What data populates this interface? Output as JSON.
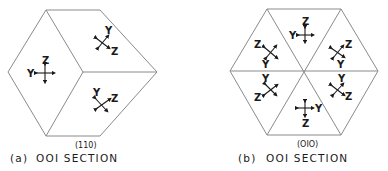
{
  "figure": {
    "panel_a": {
      "caption_prefix": "(a)",
      "caption_text": "OOI  SECTION",
      "edge_label": "(110)",
      "regions": [
        {
          "position": "left",
          "axes": [
            "Z",
            "Y"
          ]
        },
        {
          "position": "upper-right",
          "axes": [
            "Y",
            "Z"
          ]
        },
        {
          "position": "lower-right",
          "axes": [
            "Y",
            "Z"
          ]
        }
      ]
    },
    "panel_b": {
      "caption_prefix": "(b)",
      "caption_text": "OOI  SECTION",
      "edge_label": "(OIO)",
      "regions": [
        {
          "position": "top",
          "axes": [
            "Z",
            "Y"
          ]
        },
        {
          "position": "upper-left",
          "axes": [
            "Z",
            "Y"
          ]
        },
        {
          "position": "upper-right",
          "axes": [
            "Z",
            "Y"
          ]
        },
        {
          "position": "lower-left",
          "axes": [
            "Y",
            "Z"
          ]
        },
        {
          "position": "lower-right",
          "axes": [
            "Y",
            "Z"
          ]
        },
        {
          "position": "bottom",
          "axes": [
            "Y",
            "Z"
          ]
        }
      ]
    },
    "labels": {
      "Y": "Y",
      "Z": "Z"
    }
  }
}
